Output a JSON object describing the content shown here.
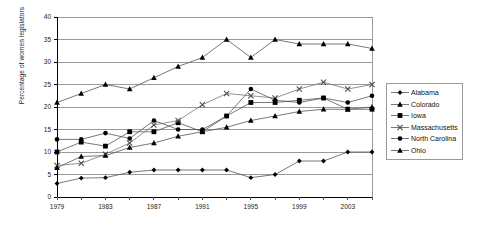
{
  "chart_data": {
    "type": "line",
    "title": "",
    "xlabel": "",
    "ylabel": "Percentage of women legislators",
    "ylim": [
      0,
      40
    ],
    "ytick_step": 5,
    "yticks": [
      "0",
      "5",
      "10",
      "15",
      "20",
      "25",
      "30",
      "35",
      "40"
    ],
    "grid": true,
    "legend_position": "right",
    "x": [
      1979,
      1981,
      1983,
      1985,
      1987,
      1989,
      1991,
      1993,
      1995,
      1997,
      1999,
      2001,
      2003,
      2005
    ],
    "xtick_labels": [
      "1979",
      "1983",
      "1987",
      "1991",
      "1995",
      "1999",
      "2003"
    ],
    "xticks_shown": [
      1979,
      1983,
      1987,
      1991,
      1995,
      1999,
      2003
    ],
    "series": [
      {
        "name": "Alabama",
        "marker": "diamond",
        "color": "#000000",
        "values": [
          3.0,
          4.2,
          4.3,
          5.5,
          6.0,
          6.0,
          6.0,
          6.0,
          4.3,
          5.0,
          8.0,
          8.0,
          10.0,
          10.0
        ]
      },
      {
        "name": "Colorado",
        "marker": "triangle",
        "color": "#000000",
        "values": [
          21.0,
          23.0,
          25.0,
          24.0,
          26.5,
          29.0,
          31.0,
          35.0,
          31.0,
          35.0,
          34.0,
          34.0,
          34.0,
          33.0
        ]
      },
      {
        "name": "Iowa",
        "marker": "square",
        "color": "#000000",
        "values": [
          10.0,
          12.2,
          11.3,
          14.5,
          14.5,
          16.5,
          14.5,
          18.0,
          21.0,
          21.0,
          21.5,
          22.0,
          19.5,
          19.5
        ]
      },
      {
        "name": "Massachusetts",
        "marker": "cross",
        "color": "#4d4d4d",
        "values": [
          7.0,
          7.5,
          9.5,
          12.0,
          16.0,
          17.0,
          20.5,
          23.0,
          22.5,
          22.0,
          24.0,
          25.5,
          24.0,
          25.0
        ]
      },
      {
        "name": "North Carolina",
        "marker": "circle",
        "color": "#000000",
        "values": [
          12.8,
          12.8,
          14.2,
          13.0,
          17.0,
          15.0,
          15.0,
          18.0,
          24.0,
          21.5,
          21.0,
          22.0,
          21.0,
          22.5
        ]
      },
      {
        "name": "Ohio",
        "marker": "triangle",
        "color": "#000000",
        "values": [
          6.5,
          9.0,
          9.2,
          11.0,
          12.0,
          13.5,
          14.5,
          15.5,
          17.0,
          18.0,
          19.0,
          19.5,
          19.5,
          20.0
        ]
      }
    ]
  }
}
